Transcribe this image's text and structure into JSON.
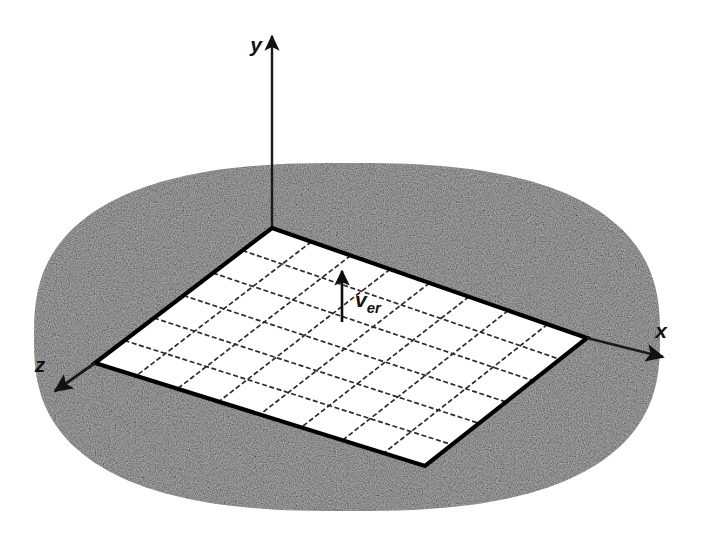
{
  "figure": {
    "kind": "3d-coordinate-diagram",
    "background_color": "#ffffff",
    "blob": {
      "name": "ground-plane-region",
      "fill_color": "#c9c9c9",
      "texture": "speckled-gray",
      "center": [
        347,
        337
      ],
      "radius_x": 313,
      "radius_y": 174,
      "squircle_exponent": 2.6
    },
    "axes": [
      {
        "id": "y",
        "label": "y",
        "label_x": 256,
        "label_y": 52,
        "from": [
          272,
          228
        ],
        "to": [
          272,
          36
        ],
        "arrow": true,
        "color": "#1a1a1a",
        "width": 2.4
      },
      {
        "id": "x",
        "label": "x",
        "label_x": 661,
        "label_y": 338,
        "from": [
          587,
          338
        ],
        "to": [
          663,
          357
        ],
        "arrow": true,
        "color": "#1a1a1a",
        "width": 2.8
      },
      {
        "id": "z",
        "label": "z",
        "label_x": 40,
        "label_y": 372,
        "from": [
          95,
          363
        ],
        "to": [
          55,
          391
        ],
        "arrow": true,
        "color": "#1a1a1a",
        "width": 2.8
      }
    ],
    "grid_plane": {
      "name": "discretized-surface-grid",
      "corner_top": [
        272,
        228
      ],
      "corner_right": [
        587,
        338
      ],
      "corner_bottom": [
        425,
        466
      ],
      "corner_left": [
        95,
        363
      ],
      "cells_u": 8,
      "cells_v": 6,
      "border_color": "#000000",
      "border_width": 4.2,
      "cell_fill": "#ffffff",
      "interior_line_color": "#2b2b2b",
      "interior_line_width": 1.7,
      "interior_line_dash": "5 2.6"
    },
    "vector": {
      "name": "velocity-vector",
      "label_main": "v",
      "label_sub": "er",
      "label_main_x": 355,
      "label_main_y": 307,
      "label_sub_x": 367,
      "label_sub_y": 313,
      "from": [
        342,
        322
      ],
      "to": [
        342,
        271
      ],
      "color": "#0d0d0d",
      "width": 2.6,
      "arrow_head_width": 10,
      "arrow_head_length": 13
    }
  }
}
